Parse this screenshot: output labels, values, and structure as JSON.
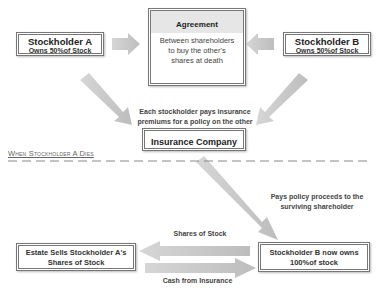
{
  "diagram": {
    "stockholder_a": {
      "title": "Stockholder A",
      "subtitle": "Owns 50%of Stock"
    },
    "stockholder_b": {
      "title": "Stockholder B",
      "subtitle": "Owns 50%of Stock"
    },
    "agreement": {
      "title": "Agreement",
      "line1": "Between shareholders",
      "line2": "to buy the other's",
      "line3": "shares at death"
    },
    "premiums_label": {
      "line1": "Each stockholder pays insurance",
      "line2": "premiums for a policy on the other"
    },
    "insurance_company": {
      "title": "Insurance Company"
    },
    "divider_label": "When Stockholder A Dies",
    "proceeds_label": {
      "line1": "Pays policy proceeds to the",
      "line2": "surviving shareholder"
    },
    "estate": {
      "line1": "Estate Sells Stockholder A's",
      "line2": "Shares of Stock"
    },
    "stockholder_b_after": {
      "line1": "Stockholder B now owns",
      "line2": "100%of stock"
    },
    "shares_label": "Shares of Stock",
    "cash_label": "Cash from Insurance"
  },
  "colors": {
    "arrow": "#c4c4c4",
    "border": "#777777",
    "agreement_header": "#e6e6e6"
  }
}
